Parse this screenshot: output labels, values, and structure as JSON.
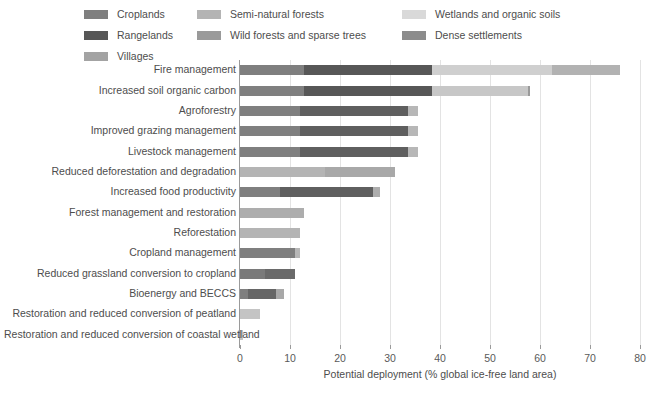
{
  "chart_data": {
    "type": "bar",
    "orientation": "horizontal",
    "stacked": true,
    "title": "",
    "xlabel": "Potential deployment (% global ice-free land area)",
    "ylabel": "",
    "xlim": [
      0,
      80
    ],
    "xticks": [
      0,
      10,
      20,
      30,
      40,
      50,
      60,
      70,
      80
    ],
    "xtick_labels": [
      "0",
      "10",
      "20",
      "30",
      "40",
      "50",
      "60",
      "70",
      "80"
    ],
    "grid": true,
    "legend_position": "top",
    "series": [
      {
        "name": "Croplands",
        "color": "#7f7f7f"
      },
      {
        "name": "Rangelands",
        "color": "#575757"
      },
      {
        "name": "Villages",
        "color": "#a3a3a3"
      },
      {
        "name": "Semi-natural forests",
        "color": "#b4b4b4"
      },
      {
        "name": "Wild forests and sparse trees",
        "color": "#9a9a9a"
      },
      {
        "name": "Wetlands and organic soils",
        "color": "#d9d9d9"
      },
      {
        "name": "Dense settlements",
        "color": "#8c8c8c"
      }
    ],
    "categories": [
      "Fire management",
      "Increased soil organic carbon",
      "Agroforestry",
      "Improved grazing management",
      "Livestock management",
      "Reduced deforestation and degradation",
      "Increased food productivity",
      "Forest management and restoration",
      "Reforestation",
      "Cropland management",
      "Reduced grassland conversion to cropland",
      "Bioenergy and BECCS",
      "Restoration and reduced conversion of peatland",
      "Restoration and reduced conversion of coastal wetland"
    ],
    "bars": [
      {
        "category": "Fire management",
        "total": 76.0,
        "segments": [
          {
            "series": "Croplands",
            "value": 12.8,
            "color": "#7f7f7f"
          },
          {
            "series": "Rangelands",
            "value": 25.6,
            "color": "#575757"
          },
          {
            "series": "Semi-natural forests",
            "value": 24.0,
            "color": "#cfcfcf"
          },
          {
            "series": "Wild forests and sparse trees",
            "value": 13.6,
            "color": "#b2b2b2"
          }
        ]
      },
      {
        "category": "Increased soil organic carbon",
        "total": 58.0,
        "segments": [
          {
            "series": "Croplands",
            "value": 12.8,
            "color": "#7f7f7f"
          },
          {
            "series": "Rangelands",
            "value": 25.6,
            "color": "#575757"
          },
          {
            "series": "Semi-natural forests",
            "value": 19.2,
            "color": "#c7c7c7"
          },
          {
            "series": "Villages",
            "value": 0.4,
            "color": "#9a9a9a"
          }
        ]
      },
      {
        "category": "Agroforestry",
        "total": 35.6,
        "segments": [
          {
            "series": "Croplands",
            "value": 12.0,
            "color": "#7f7f7f"
          },
          {
            "series": "Rangelands",
            "value": 21.6,
            "color": "#5f5f5f"
          },
          {
            "series": "Villages",
            "value": 2.0,
            "color": "#b7b7b7"
          }
        ]
      },
      {
        "category": "Improved grazing management",
        "total": 35.6,
        "segments": [
          {
            "series": "Croplands",
            "value": 12.0,
            "color": "#7f7f7f"
          },
          {
            "series": "Rangelands",
            "value": 21.6,
            "color": "#5f5f5f"
          },
          {
            "series": "Villages",
            "value": 2.0,
            "color": "#b7b7b7"
          }
        ]
      },
      {
        "category": "Livestock management",
        "total": 35.6,
        "segments": [
          {
            "series": "Croplands",
            "value": 12.0,
            "color": "#7f7f7f"
          },
          {
            "series": "Rangelands",
            "value": 21.6,
            "color": "#5f5f5f"
          },
          {
            "series": "Villages",
            "value": 2.0,
            "color": "#b7b7b7"
          }
        ]
      },
      {
        "category": "Reduced deforestation and degradation",
        "total": 31.0,
        "segments": [
          {
            "series": "Semi-natural forests",
            "value": 17.0,
            "color": "#b4b4b4"
          },
          {
            "series": "Wild forests and sparse trees",
            "value": 14.0,
            "color": "#a8a8a8"
          }
        ]
      },
      {
        "category": "Increased food productivity",
        "total": 28.0,
        "segments": [
          {
            "series": "Croplands",
            "value": 8.0,
            "color": "#7f7f7f"
          },
          {
            "series": "Rangelands",
            "value": 18.6,
            "color": "#5f5f5f"
          },
          {
            "series": "Villages",
            "value": 1.4,
            "color": "#adadad"
          }
        ]
      },
      {
        "category": "Forest management and restoration",
        "total": 12.8,
        "segments": [
          {
            "series": "Semi-natural forests",
            "value": 12.8,
            "color": "#adadad"
          }
        ]
      },
      {
        "category": "Reforestation",
        "total": 12.0,
        "segments": [
          {
            "series": "Semi-natural forests",
            "value": 12.0,
            "color": "#b4b4b4"
          }
        ]
      },
      {
        "category": "Cropland management",
        "total": 12.0,
        "segments": [
          {
            "series": "Croplands",
            "value": 11.0,
            "color": "#7f7f7f"
          },
          {
            "series": "Villages",
            "value": 1.0,
            "color": "#b7b7b7"
          }
        ]
      },
      {
        "category": "Reduced grassland conversion to cropland",
        "total": 11.0,
        "segments": [
          {
            "series": "Croplands",
            "value": 5.0,
            "color": "#7a7a7a"
          },
          {
            "series": "Rangelands",
            "value": 6.0,
            "color": "#6a6a6a"
          }
        ]
      },
      {
        "category": "Bioenergy and BECCS",
        "total": 8.8,
        "segments": [
          {
            "series": "Croplands",
            "value": 1.6,
            "color": "#7f7f7f"
          },
          {
            "series": "Rangelands",
            "value": 5.6,
            "color": "#666666"
          },
          {
            "series": "Villages",
            "value": 1.6,
            "color": "#a8a8a8"
          }
        ]
      },
      {
        "category": "Restoration and reduced conversion of peatland",
        "total": 4.0,
        "segments": [
          {
            "series": "Wetlands and organic soils",
            "value": 4.0,
            "color": "#c4c4c4"
          }
        ]
      },
      {
        "category": "Restoration and reduced conversion of coastal wetland",
        "total": 0.6,
        "segments": [
          {
            "series": "Wetlands and organic soils",
            "value": 0.6,
            "color": "#c4c4c4"
          }
        ]
      }
    ]
  },
  "legend": {
    "columns": [
      {
        "items": [
          {
            "label": "Croplands",
            "color": "#7f7f7f"
          },
          {
            "label": "Rangelands",
            "color": "#575757"
          },
          {
            "label": "Villages",
            "color": "#a3a3a3"
          }
        ]
      },
      {
        "items": [
          {
            "label": "Semi-natural forests",
            "color": "#b4b4b4"
          },
          {
            "label": "Wild forests and sparse trees",
            "color": "#9a9a9a"
          }
        ]
      },
      {
        "items": [
          {
            "label": "Wetlands and organic soils",
            "color": "#d9d9d9"
          },
          {
            "label": "Dense settlements",
            "color": "#8c8c8c"
          }
        ]
      }
    ]
  }
}
